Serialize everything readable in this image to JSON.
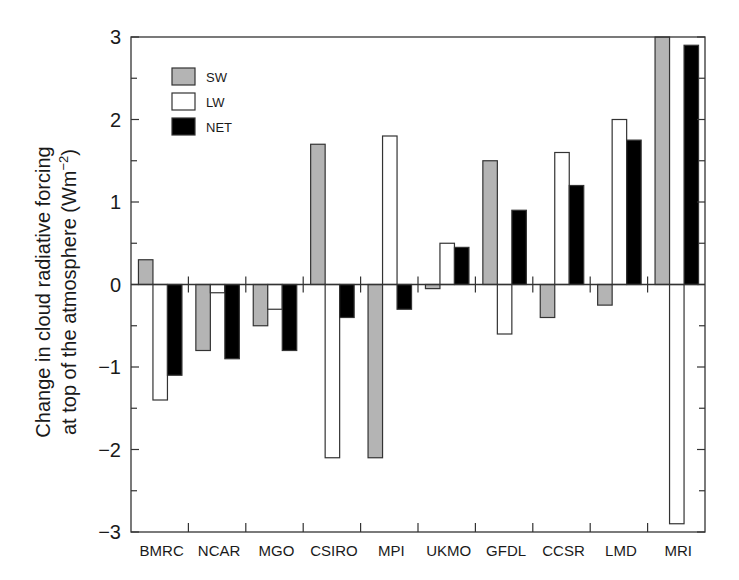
{
  "chart_data": {
    "type": "bar",
    "title": "",
    "xlabel": "",
    "ylabel": "Change in cloud radiative forcing at top of the atmosphere (Wm−2)",
    "ylabel_lines": [
      "Change in cloud radiative forcing",
      "at top of the atmosphere (Wm",
      "−2",
      ")"
    ],
    "ylim": [
      -3,
      3
    ],
    "yticks": [
      -3,
      -2,
      -1,
      0,
      1,
      2,
      3
    ],
    "yminor_step": 0.5,
    "grid": false,
    "legend_position": "upper-left",
    "categories": [
      "BMRC",
      "NCAR",
      "MGO",
      "CSIRO",
      "MPI",
      "UKMO",
      "GFDL",
      "CCSR",
      "LMD",
      "MRI"
    ],
    "series": [
      {
        "name": "SW",
        "color": "#b4b4b4",
        "values": [
          0.3,
          -0.8,
          -0.5,
          1.7,
          -2.1,
          -0.05,
          1.5,
          -0.4,
          -0.25,
          3.0
        ]
      },
      {
        "name": "LW",
        "color": "#ffffff",
        "values": [
          -1.4,
          -0.1,
          -0.3,
          -2.1,
          1.8,
          0.5,
          -0.6,
          1.6,
          2.0,
          -2.9
        ]
      },
      {
        "name": "NET",
        "color": "#000000",
        "values": [
          -1.1,
          -0.9,
          -0.8,
          -0.4,
          -0.3,
          0.45,
          0.9,
          1.2,
          1.75,
          2.9
        ]
      }
    ]
  }
}
